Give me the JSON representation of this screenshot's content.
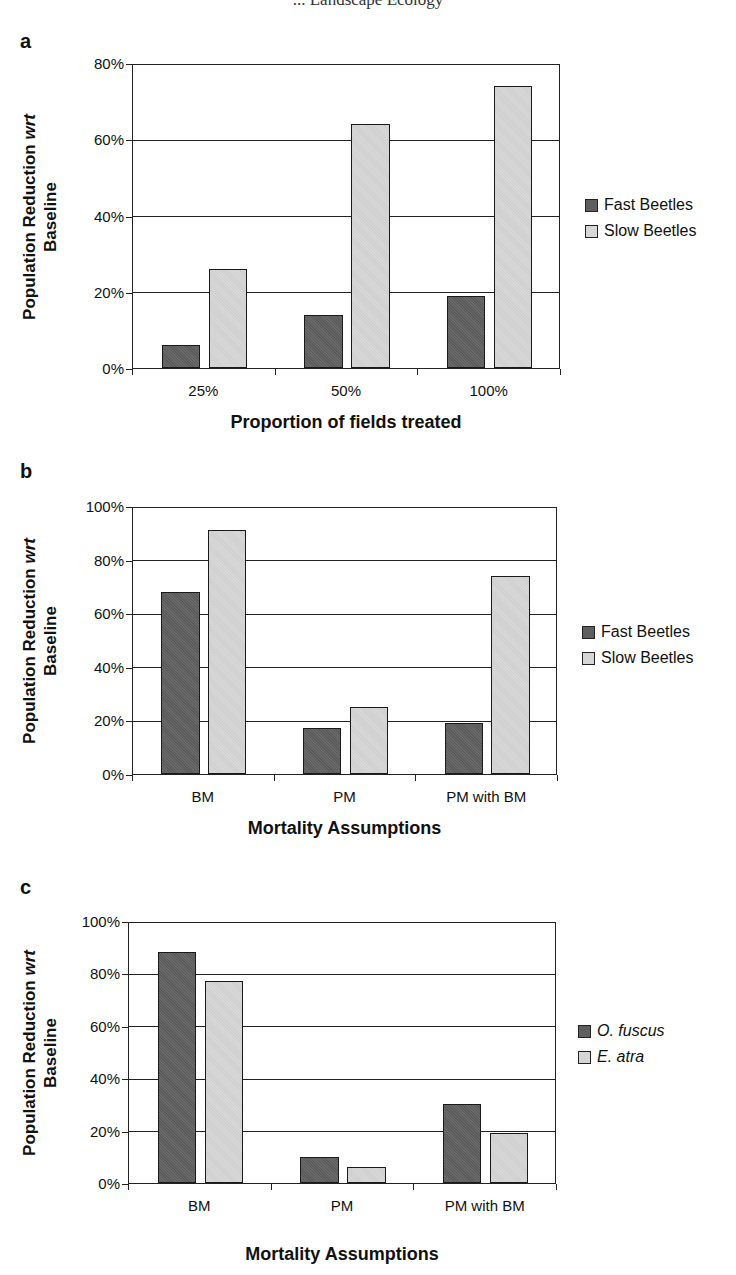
{
  "page": {
    "header_partial": "... Landscape Ecology"
  },
  "panels": [
    {
      "letter": "a",
      "ylabel_line1": "Population Reduction wrt",
      "ylabel_line2": "Baseline",
      "xlabel": "Proportion of fields treated",
      "yticks": [
        "0%",
        "20%",
        "40%",
        "60%",
        "80%"
      ],
      "ymax": 80,
      "categories": [
        "25%",
        "50%",
        "100%"
      ],
      "legend": [
        {
          "label": "Fast Beetles",
          "style": "dark"
        },
        {
          "label": "Slow Beetles",
          "style": "light"
        }
      ]
    },
    {
      "letter": "b",
      "ylabel_line1": "Population Reduction wrt",
      "ylabel_line2": "Baseline",
      "xlabel": "Mortality Assumptions",
      "yticks": [
        "0%",
        "20%",
        "40%",
        "60%",
        "80%",
        "100%"
      ],
      "ymax": 100,
      "categories": [
        "BM",
        "PM",
        "PM with BM"
      ],
      "legend": [
        {
          "label": "Fast Beetles",
          "style": "dark"
        },
        {
          "label": "Slow Beetles",
          "style": "light"
        }
      ]
    },
    {
      "letter": "c",
      "ylabel_line1": "Population Reduction wrt",
      "ylabel_line2": "Baseline",
      "xlabel": "Mortality Assumptions",
      "yticks": [
        "0%",
        "20%",
        "40%",
        "60%",
        "80%",
        "100%"
      ],
      "ymax": 100,
      "categories": [
        "BM",
        "PM",
        "PM with BM"
      ],
      "legend": [
        {
          "label": "O. fuscus",
          "style": "dark"
        },
        {
          "label": "E. atra",
          "style": "light"
        }
      ]
    }
  ],
  "chart_data": [
    {
      "type": "bar",
      "title": "a",
      "xlabel": "Proportion of fields treated",
      "ylabel": "Population Reduction wrt Baseline",
      "categories": [
        "25%",
        "50%",
        "100%"
      ],
      "series": [
        {
          "name": "Fast Beetles",
          "values": [
            6,
            14,
            19
          ]
        },
        {
          "name": "Slow Beetles",
          "values": [
            26,
            64,
            74
          ]
        }
      ],
      "ylim": [
        0,
        80
      ],
      "yticks": [
        "0%",
        "20%",
        "40%",
        "60%",
        "80%"
      ],
      "grid": true,
      "legend_position": "right"
    },
    {
      "type": "bar",
      "title": "b",
      "xlabel": "Mortality Assumptions",
      "ylabel": "Population Reduction wrt Baseline",
      "categories": [
        "BM",
        "PM",
        "PM with BM"
      ],
      "series": [
        {
          "name": "Fast Beetles",
          "values": [
            68,
            17,
            19
          ]
        },
        {
          "name": "Slow Beetles",
          "values": [
            91,
            25,
            74
          ]
        }
      ],
      "ylim": [
        0,
        100
      ],
      "yticks": [
        "0%",
        "20%",
        "40%",
        "60%",
        "80%",
        "100%"
      ],
      "grid": true,
      "legend_position": "right"
    },
    {
      "type": "bar",
      "title": "c",
      "xlabel": "Mortality Assumptions",
      "ylabel": "Population Reduction wrt Baseline",
      "categories": [
        "BM",
        "PM",
        "PM with BM"
      ],
      "series": [
        {
          "name": "O. fuscus",
          "values": [
            88,
            10,
            30
          ]
        },
        {
          "name": "E. atra",
          "values": [
            77,
            6,
            19
          ]
        }
      ],
      "ylim": [
        0,
        100
      ],
      "yticks": [
        "0%",
        "20%",
        "40%",
        "60%",
        "80%",
        "100%"
      ],
      "grid": true,
      "legend_position": "right"
    }
  ]
}
